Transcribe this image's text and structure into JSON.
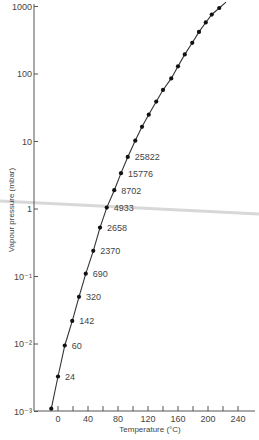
{
  "chart_data": {
    "type": "line",
    "title": "",
    "xlabel": "Temperature (°C)",
    "ylabel": "Vapour pressure (mbar)",
    "xscale": "linear",
    "yscale": "log",
    "xlim": [
      -32,
      265
    ],
    "ylim": [
      0.001,
      1000
    ],
    "grid": false,
    "legend": null,
    "x_ticks": [
      0,
      40,
      80,
      120,
      160,
      200,
      240
    ],
    "x_minor_ticks": [
      20,
      60,
      100,
      140,
      180,
      220
    ],
    "y_ticks": [
      {
        "value": 1000,
        "label": "1000"
      },
      {
        "value": 100,
        "label": "100"
      },
      {
        "value": 10,
        "label": "10"
      },
      {
        "value": 1,
        "label": "1"
      },
      {
        "value": 0.1,
        "label": "10⁻¹"
      },
      {
        "value": 0.01,
        "label": "10⁻²"
      },
      {
        "value": 0.001,
        "label": "10⁻³"
      }
    ],
    "series": [
      {
        "name": "Vapour pressure",
        "marker": "circle",
        "line": "solid",
        "x": [
          -9,
          0,
          9,
          19,
          28,
          37,
          47,
          56,
          65,
          75,
          84,
          93,
          103,
          112,
          121,
          131,
          140,
          151,
          160,
          169,
          179,
          188,
          197,
          205,
          215
        ],
        "y": [
          0.0011,
          0.0033,
          0.0095,
          0.022,
          0.05,
          0.11,
          0.24,
          0.53,
          1.05,
          1.9,
          3.4,
          5.9,
          10.3,
          16.5,
          25,
          39,
          58,
          86,
          130,
          195,
          290,
          420,
          580,
          760,
          950
        ]
      }
    ],
    "annotations": [
      {
        "text": "24",
        "x": 0,
        "y": 0.0033
      },
      {
        "text": "60",
        "x": 9,
        "y": 0.0095
      },
      {
        "text": "142",
        "x": 19,
        "y": 0.022
      },
      {
        "text": "320",
        "x": 28,
        "y": 0.05
      },
      {
        "text": "690",
        "x": 37,
        "y": 0.11
      },
      {
        "text": "2370",
        "x": 47,
        "y": 0.24
      },
      {
        "text": "2658",
        "x": 56,
        "y": 0.53
      },
      {
        "text": "4933",
        "x": 65,
        "y": 1.05
      },
      {
        "text": "8702",
        "x": 75,
        "y": 1.9
      },
      {
        "text": "15776",
        "x": 84,
        "y": 3.4
      },
      {
        "text": "25822",
        "x": 93,
        "y": 5.9
      }
    ]
  }
}
